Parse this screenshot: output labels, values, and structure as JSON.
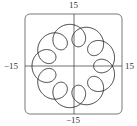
{
  "chart_data": {
    "type": "line",
    "title": "",
    "xlabel": "",
    "ylabel": "",
    "xlim": [
      -15,
      15
    ],
    "ylim": [
      -15,
      15
    ],
    "grid": false,
    "axes_through_origin": true,
    "tick_labels": {
      "top": "15",
      "bottom": "−15",
      "left": "−15",
      "right": "15"
    },
    "curve": {
      "kind": "parametric",
      "x": "11 cos t - 4 cos 10t",
      "y": "11 sin t - 4 sin 10t",
      "t_range": [
        0,
        6.2832
      ],
      "a": 11,
      "b": 4,
      "k": 10,
      "loops": 9,
      "outer_radius": 15,
      "inner_radius": 7
    },
    "frame": {
      "shape": "rounded-square",
      "color": "#555555"
    },
    "line_color": "#222222"
  }
}
